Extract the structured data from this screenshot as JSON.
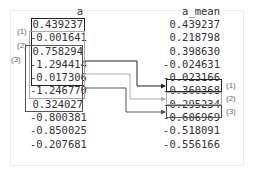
{
  "diagram": {
    "column_a": {
      "header": "a",
      "values": [
        "0.439237",
        "-0.001641",
        "0.758294",
        "-1.294414",
        "-0.017306",
        "-1.246770",
        "0.324027",
        "-0.800381",
        "-0.850025",
        "-0.207681"
      ]
    },
    "column_b": {
      "header": "a_mean",
      "values": [
        "0.439237",
        "0.218798",
        "0.398630",
        "-0.024631",
        "-0.023166",
        "-0.360368",
        "-0.295234",
        "-0.606969",
        "-0.518091",
        "-0.556166"
      ]
    },
    "windows": [
      {
        "label": "(1)",
        "source_rows": [
          0,
          4
        ],
        "arrow_from_row": 2,
        "target_row": 4,
        "color": "#222222"
      },
      {
        "label": "(2)",
        "source_rows": [
          1,
          5
        ],
        "arrow_from_row": 3,
        "target_row": 5,
        "color": "#999999"
      },
      {
        "label": "(3)",
        "source_rows": [
          2,
          6
        ],
        "arrow_from_row": 4,
        "target_row": 6,
        "color": "#555555"
      }
    ]
  }
}
